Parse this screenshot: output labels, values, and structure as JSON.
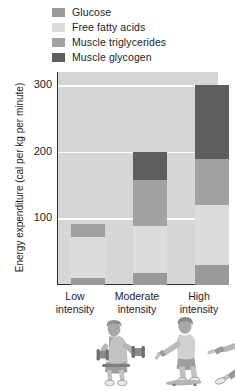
{
  "chart_data": {
    "type": "bar",
    "subtype": "stacked-bar",
    "title": "",
    "xlabel": "",
    "ylabel": "Energy expenditure (cal per kg per minute)",
    "categories": [
      "Low intensity",
      "Moderate intensity",
      "High intensity"
    ],
    "ylim": [
      0,
      320
    ],
    "yticks": [
      100,
      200,
      300
    ],
    "ytick_labels": [
      "100",
      "200",
      "300"
    ],
    "grid": true,
    "legend_position": "top-left",
    "series": [
      {
        "name": "Glucose",
        "color": "#9a9a9a",
        "values": [
          10,
          18,
          30
        ]
      },
      {
        "name": "Free fatty acids",
        "color": "#dcdcdc",
        "values": [
          62,
          70,
          90
        ]
      },
      {
        "name": "Muscle triglycerides",
        "color": "#a2a2a2",
        "values": [
          20,
          70,
          70
        ]
      },
      {
        "name": "Muscle glycogen",
        "color": "#5e5e5e",
        "values": [
          0,
          42,
          110
        ]
      }
    ],
    "totals": [
      92,
      200,
      300
    ],
    "plot_background": "#d6d6d6",
    "gridline_color": "#ffffff",
    "axis_color": "#2b2b2b"
  },
  "legend": {
    "items": [
      {
        "label": "Glucose",
        "color": "#9a9a9a"
      },
      {
        "label": "Free fatty acids",
        "color": "#dcdcdc"
      },
      {
        "label": "Muscle triglycerides",
        "color": "#a2a2a2"
      },
      {
        "label": "Muscle glycogen",
        "color": "#5e5e5e"
      }
    ]
  },
  "axes": {
    "y_title": "Energy expenditure (cal per kg per minute)",
    "y_tick_300": "300",
    "y_tick_200": "200",
    "y_tick_100": "100"
  },
  "x_categories": [
    {
      "line1": "Low",
      "line2": "intensity"
    },
    {
      "line1": "Moderate",
      "line2": "intensity"
    },
    {
      "line1": "High",
      "line2": "intensity"
    }
  ],
  "illustrations": [
    {
      "name": "seated-dumbbell-exerciser"
    },
    {
      "name": "skateboarder"
    },
    {
      "name": "sprinting-runner"
    }
  ]
}
